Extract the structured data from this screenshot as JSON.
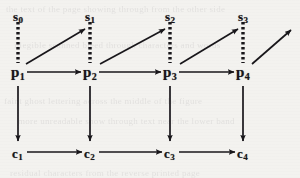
{
  "figure": {
    "type": "lattice-commutative-diagram",
    "background_color": "#f3f2ef",
    "ink_color": "#18161a",
    "rows": [
      {
        "id": "s-row",
        "name": "state-row",
        "y": 18
      },
      {
        "id": "p-row",
        "name": "process-row",
        "y": 76
      },
      {
        "id": "c-row",
        "name": "context-row",
        "y": 155
      }
    ],
    "columns": [
      18,
      90,
      170,
      243
    ]
  },
  "nodes": {
    "s": [
      {
        "base": "s",
        "sub": "0",
        "label": "s0",
        "x": 18,
        "y": 18
      },
      {
        "base": "s",
        "sub": "1",
        "label": "s1",
        "x": 90,
        "y": 18
      },
      {
        "base": "s",
        "sub": "2",
        "label": "s2",
        "x": 170,
        "y": 18
      },
      {
        "base": "s",
        "sub": "3",
        "label": "s3",
        "x": 243,
        "y": 18
      }
    ],
    "p": [
      {
        "base": "p",
        "sub": "1",
        "label": "p1",
        "x": 18,
        "y": 76
      },
      {
        "base": "p",
        "sub": "2",
        "label": "p2",
        "x": 90,
        "y": 76
      },
      {
        "base": "p",
        "sub": "3",
        "label": "p3",
        "x": 170,
        "y": 76
      },
      {
        "base": "p",
        "sub": "4",
        "label": "p4",
        "x": 243,
        "y": 76
      }
    ],
    "c": [
      {
        "base": "c",
        "sub": "1",
        "label": "c1",
        "x": 18,
        "y": 155
      },
      {
        "base": "c",
        "sub": "2",
        "label": "c2",
        "x": 90,
        "y": 155
      },
      {
        "base": "c",
        "sub": "3",
        "label": "c3",
        "x": 170,
        "y": 155
      },
      {
        "base": "c",
        "sub": "4",
        "label": "c4",
        "x": 243,
        "y": 155
      }
    ]
  },
  "edges": {
    "p_to_p": [
      {
        "from": "p1",
        "to": "p2",
        "style": "solid",
        "direction": "right"
      },
      {
        "from": "p2",
        "to": "p3",
        "style": "solid",
        "direction": "right"
      },
      {
        "from": "p3",
        "to": "p4",
        "style": "solid",
        "direction": "right"
      }
    ],
    "c_to_c": [
      {
        "from": "c1",
        "to": "c2",
        "style": "solid",
        "direction": "right"
      },
      {
        "from": "c2",
        "to": "c3",
        "style": "solid",
        "direction": "right"
      },
      {
        "from": "c3",
        "to": "c4",
        "style": "solid",
        "direction": "right"
      }
    ],
    "p_to_c": [
      {
        "from": "p1",
        "to": "c1",
        "style": "solid",
        "direction": "down"
      },
      {
        "from": "p2",
        "to": "c2",
        "style": "solid",
        "direction": "down"
      },
      {
        "from": "p3",
        "to": "c3",
        "style": "solid",
        "direction": "down"
      },
      {
        "from": "p4",
        "to": "c4",
        "style": "solid",
        "direction": "down"
      }
    ],
    "p_to_s_diagonal": [
      {
        "from": "p1",
        "to": "s1",
        "style": "solid",
        "direction": "up-right"
      },
      {
        "from": "p2",
        "to": "s2",
        "style": "solid",
        "direction": "up-right"
      },
      {
        "from": "p3",
        "to": "s3",
        "style": "solid",
        "direction": "up-right"
      },
      {
        "from": "p4",
        "to": "",
        "style": "solid",
        "direction": "up-right"
      }
    ],
    "dashed_verticals": [
      {
        "at": "s0",
        "from": "s0",
        "to": "p1",
        "style": "dashed"
      },
      {
        "at": "s1",
        "from": "s1",
        "to": "p2",
        "style": "dashed"
      },
      {
        "at": "s2",
        "from": "s2",
        "to": "p3",
        "style": "dashed"
      },
      {
        "at": "s3",
        "from": "s3",
        "to": "p4",
        "style": "dashed"
      }
    ]
  },
  "background_bleed": {
    "note": "faint illegible reverse-side text from scanned page",
    "lines": [
      "the text of the page showing through from the other side",
      "illegible scanned bleed through characters and words",
      "faint ghost lettering across the middle of the figure",
      "more unreadable show through text near the lower band",
      "residual characters from the reverse printed page"
    ]
  }
}
